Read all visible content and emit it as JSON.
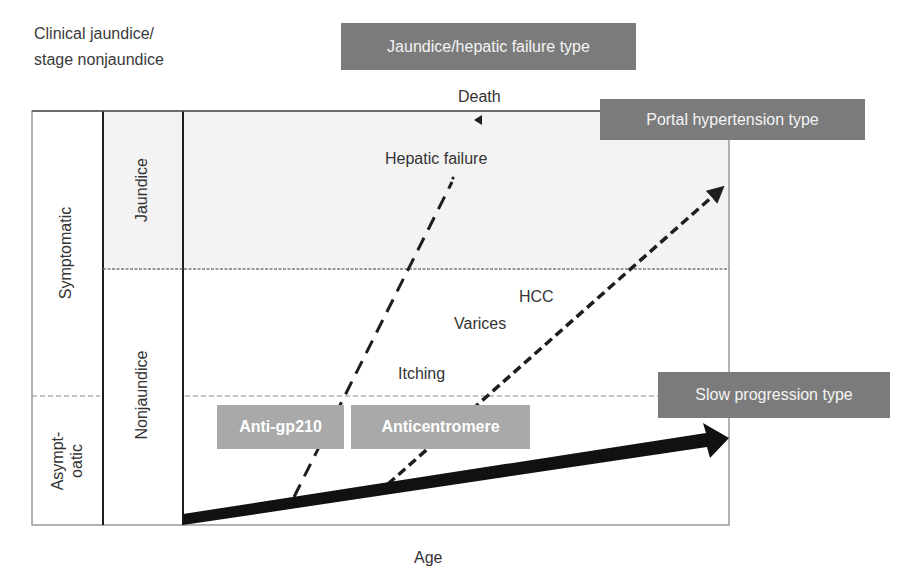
{
  "diagram": {
    "corner_label": {
      "line1": "Clinical jaundice/",
      "line2": "stage nonjaundice"
    },
    "x_axis_label": "Age",
    "clinical_stages": {
      "symptomatic": "Symptomatic",
      "asymptomatic_line1": "Asympt-",
      "asymptomatic_line2": "oatic"
    },
    "jaundice_stages": {
      "jaundice": "Jaundice",
      "nonjaundice": "Nonjaundice"
    },
    "progression_types": {
      "jaundice_hepatic_failure": "Jaundice/hepatic failure type",
      "portal_hypertension": "Portal hypertension type",
      "slow_progression": "Slow progression type"
    },
    "antibodies": {
      "anti_gp210": "Anti-gp210",
      "anticentromere": "Anticentromere"
    },
    "events": {
      "death": "Death",
      "hepatic_failure": "Hepatic failure",
      "hcc": "HCC",
      "varices": "Varices",
      "itching": "Itching"
    },
    "colors": {
      "type_box": "#7b7b7b",
      "antibody_box": "#a9a9a9",
      "jaundice_region_shade": "#f3f3f3",
      "line": "#1e1e1e",
      "grid": "#8a8a8a"
    }
  }
}
